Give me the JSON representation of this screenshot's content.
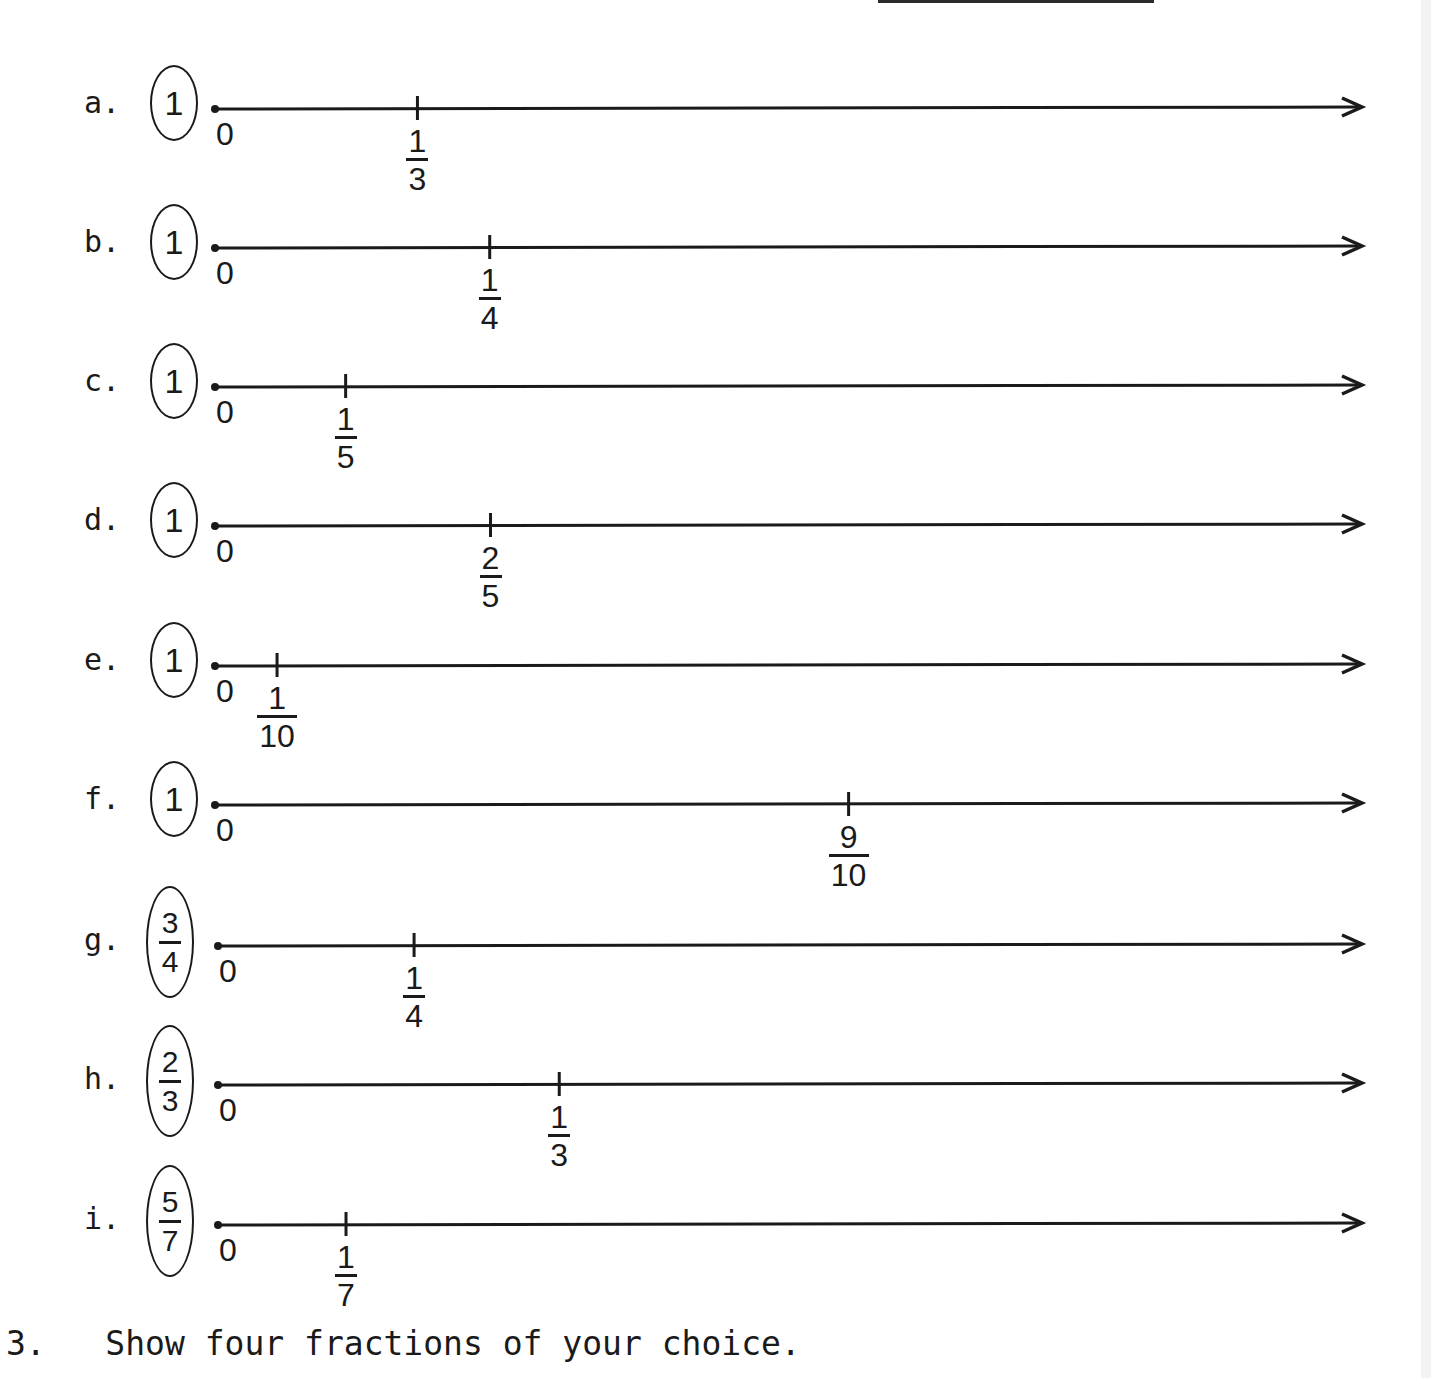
{
  "problems": [
    {
      "label": "a.",
      "unit": {
        "num": "1",
        "den": null
      },
      "zero_label": "0",
      "mark": {
        "num": "1",
        "den": "3",
        "value": 0.1765
      }
    },
    {
      "label": "b.",
      "unit": {
        "num": "1",
        "den": null
      },
      "zero_label": "0",
      "mark": {
        "num": "1",
        "den": "4",
        "value": 0.2395
      }
    },
    {
      "label": "c.",
      "unit": {
        "num": "1",
        "den": null
      },
      "zero_label": "0",
      "mark": {
        "num": "1",
        "den": "5",
        "value": 0.1139
      }
    },
    {
      "label": "d.",
      "unit": {
        "num": "1",
        "den": null
      },
      "zero_label": "0",
      "mark": {
        "num": "2",
        "den": "5",
        "value": 0.2402
      }
    },
    {
      "label": "e.",
      "unit": {
        "num": "1",
        "den": null
      },
      "zero_label": "0",
      "mark": {
        "num": "1",
        "den": "10",
        "value": 0.0541
      }
    },
    {
      "label": "f.",
      "unit": {
        "num": "1",
        "den": null
      },
      "zero_label": "0",
      "mark": {
        "num": "9",
        "den": "10",
        "value": 0.5524
      }
    },
    {
      "label": "g.",
      "unit": {
        "num": "3",
        "den": "4"
      },
      "zero_label": "0",
      "mark": {
        "num": "1",
        "den": "4",
        "value": 0.1714
      }
    },
    {
      "label": "h.",
      "unit": {
        "num": "2",
        "den": "3"
      },
      "zero_label": "0",
      "mark": {
        "num": "1",
        "den": "3",
        "value": 0.2983
      }
    },
    {
      "label": "i.",
      "unit": {
        "num": "5",
        "den": "7"
      },
      "zero_label": "0",
      "mark": {
        "num": "1",
        "den": "7",
        "value": 0.1119
      }
    }
  ],
  "question": {
    "number": "3.",
    "text": "Show four fractions of your choice."
  }
}
